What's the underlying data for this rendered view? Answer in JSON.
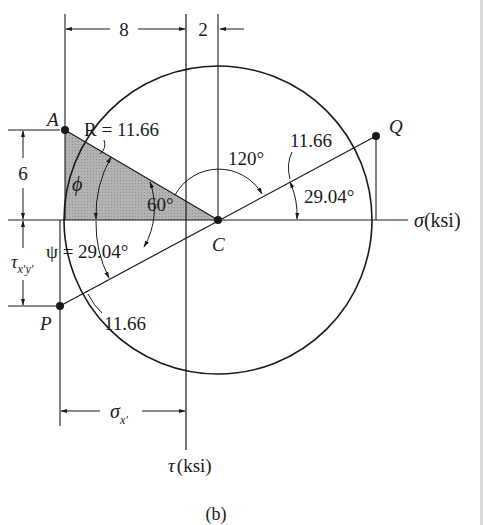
{
  "figure": {
    "caption": "(b)",
    "axes": {
      "sigma_label": "σ",
      "sigma_unit": "(ksi)",
      "tau_label": "τ",
      "tau_unit": "(ksi)"
    },
    "points": {
      "A": "A",
      "C": "C",
      "P": "P",
      "Q": "Q"
    },
    "dimensions": {
      "top_left": "8",
      "top_right": "2",
      "left_upper": "6",
      "left_lower_main": "τ",
      "left_lower_sub": "x′y′",
      "bottom_main": "σ",
      "bottom_sub": "x′"
    },
    "labels": {
      "radius": "R = 11.66",
      "radius_Q": "11.66",
      "radius_P": "11.66",
      "phi": "ϕ",
      "angle_60": "60°",
      "angle_120": "120°",
      "angle_Q": "29.04°",
      "psi": "ψ = 29.04°"
    },
    "colors": {
      "line": "#1a1a1a",
      "shade": "#a8a8a8",
      "edge": "#d9d9d9"
    }
  }
}
